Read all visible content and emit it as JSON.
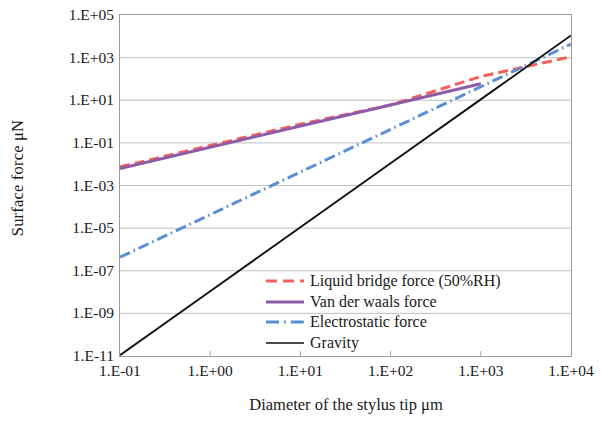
{
  "chart_data": {
    "type": "line",
    "title": "",
    "xlabel": "Diameter of the stylus tip  μm",
    "ylabel": "Surface force  μN",
    "xscale": "log",
    "yscale": "log",
    "xlim": [
      0.1,
      10000
    ],
    "ylim": [
      1e-11,
      100000.0
    ],
    "xticklabels": [
      "1.E-01",
      "1.E+00",
      "1.E+01",
      "1.E+02",
      "1.E+03",
      "1.E+04"
    ],
    "xtickvalues": [
      0.1,
      1,
      10,
      100,
      1000,
      10000
    ],
    "yticklabels": [
      "1.E+05",
      "1.E+03",
      "1.E+01",
      "1.E-01",
      "1.E-03",
      "1.E-05",
      "1.E-07",
      "1.E-09",
      "1.E-11"
    ],
    "ytickvalues": [
      100000.0,
      1000.0,
      10.0,
      0.1,
      0.001,
      1e-05,
      1e-07,
      1e-09,
      1e-11
    ],
    "grid": "horizontal",
    "legend_position": "lower-right-inside",
    "series": [
      {
        "name": "Liquid bridge force (50%RH)",
        "color": "#F4605A",
        "style": "dashed",
        "x": [
          0.1,
          1,
          10,
          100,
          1000,
          10000
        ],
        "y": [
          0.0075,
          0.075,
          0.75,
          6.0,
          130.0,
          1100.0
        ]
      },
      {
        "name": "Van der waals force",
        "color": "#8E5BA8",
        "style": "solid",
        "x": [
          0.1,
          1,
          10,
          100,
          1000
        ],
        "y": [
          0.0062,
          0.062,
          0.62,
          6.0,
          60.0
        ]
      },
      {
        "name": "Electrostatic force",
        "color": "#5B8FD4",
        "style": "dash-dot",
        "x": [
          0.1,
          1,
          10,
          100,
          1000,
          10000
        ],
        "y": [
          4.3e-07,
          4.3e-05,
          0.0043,
          0.43,
          43.0,
          4300.0
        ]
      },
      {
        "name": "Gravity",
        "color": "#111111",
        "style": "solid",
        "x": [
          0.1,
          1,
          10,
          100,
          1000,
          10000
        ],
        "y": [
          1.1e-11,
          1.1e-08,
          1.1e-05,
          0.011,
          11.0,
          11000.0
        ]
      }
    ]
  },
  "legend": {
    "items": [
      {
        "label": "Liquid bridge force (50%RH)",
        "color": "#F4605A",
        "style": "dashed"
      },
      {
        "label": "Van der waals force",
        "color": "#8E5BA8",
        "style": "solid"
      },
      {
        "label": "Electrostatic force",
        "color": "#5B8FD4",
        "style": "dash-dot"
      },
      {
        "label": "Gravity",
        "color": "#111111",
        "style": "solid"
      }
    ]
  }
}
